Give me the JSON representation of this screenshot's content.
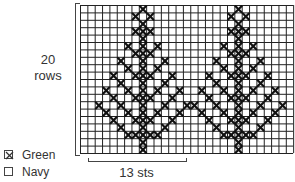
{
  "chart_data": {
    "type": "heatmap",
    "grid": {
      "cols": 29,
      "rows": 20
    },
    "repeat": {
      "width_sts": 13,
      "label": "13 sts"
    },
    "height_label": "20 rows",
    "legend": [
      {
        "symbol": "cross",
        "label": "Green",
        "color": "#2e7d32"
      },
      {
        "symbol": "blank",
        "label": "Navy",
        "color": "#1a237e"
      }
    ],
    "tree_trunk_columns": [
      8,
      21
    ],
    "motif_offsets_by_row": [
      [
        0
      ],
      [
        -1,
        1
      ],
      [
        0
      ],
      [
        -1,
        0,
        1
      ],
      [
        0
      ],
      [
        -2,
        0,
        2
      ],
      [
        -1,
        0,
        1
      ],
      [
        -3,
        0,
        3
      ],
      [
        -2,
        0,
        2
      ],
      [
        -4,
        -1,
        0,
        1,
        4
      ],
      [
        -3,
        0,
        3
      ],
      [
        -5,
        -2,
        0,
        2,
        5
      ],
      [
        -4,
        -1,
        0,
        1,
        4
      ],
      [
        -6,
        -3,
        0,
        3,
        6
      ],
      [
        -5,
        -2,
        0,
        2,
        5
      ],
      [
        -4,
        -1,
        0,
        1,
        4
      ],
      [
        -3,
        0,
        3
      ],
      [
        -2,
        -1,
        0,
        1,
        2
      ],
      [
        0
      ],
      [
        0
      ]
    ]
  },
  "labels": {
    "rows_count": "20",
    "rows_word": "rows",
    "sts": "13 sts"
  },
  "legend": {
    "green": "Green",
    "navy": "Navy"
  }
}
